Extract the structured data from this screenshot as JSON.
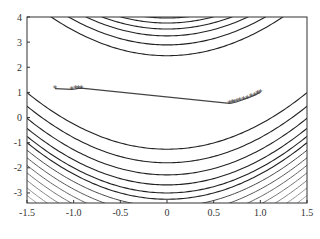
{
  "chart_data": {
    "type": "line",
    "title": "",
    "xlabel": "",
    "ylabel": "",
    "xlim": [
      -1.5,
      1.5
    ],
    "ylim": [
      -3.4,
      4
    ],
    "grid": false,
    "legend": null,
    "x_ticks": [
      -1.5,
      -1.0,
      -0.5,
      0,
      0.5,
      1.0,
      1.5
    ],
    "x_tick_labels": [
      "-1.5",
      "-1.0",
      "-0.5",
      "0",
      "0.5",
      "1.0",
      "1.5"
    ],
    "y_ticks": [
      -3,
      -2,
      -1,
      0,
      1,
      2,
      3,
      4
    ],
    "y_tick_labels": [
      "-3",
      "-2",
      "-1",
      "0",
      "1",
      "2",
      "3",
      "4"
    ],
    "background": {
      "type": "contour",
      "description": "Level curves of a Rosenbrock-like function, parabolic curves y = x^2 + offset",
      "upper_offsets": [
        2.46,
        2.89,
        3.25,
        3.52,
        3.76,
        3.96,
        4.15,
        4.32
      ],
      "lower_offsets": [
        -1.26,
        -1.8,
        -2.28,
        -2.68,
        -3.0,
        -3.25,
        -3.55,
        -3.85,
        -4.15,
        -4.45,
        -4.75,
        -5.05,
        -5.35,
        -5.65,
        -5.95
      ],
      "line_color": "#222222",
      "fade_color": "#bbbbbb"
    },
    "series": [
      {
        "name": "optimization path",
        "marker": "*",
        "color": "#444444",
        "points": [
          [
            -1.2,
            1.15
          ],
          [
            -1.02,
            1.12
          ],
          [
            -0.98,
            1.14
          ],
          [
            -0.95,
            1.16
          ],
          [
            -0.92,
            1.17
          ],
          [
            0.67,
            0.56
          ],
          [
            0.7,
            0.58
          ],
          [
            0.72,
            0.6
          ],
          [
            0.75,
            0.63
          ],
          [
            0.78,
            0.67
          ],
          [
            0.82,
            0.72
          ],
          [
            0.86,
            0.77
          ],
          [
            0.9,
            0.83
          ],
          [
            0.94,
            0.89
          ],
          [
            0.97,
            0.95
          ],
          [
            1.0,
            1.0
          ]
        ]
      }
    ]
  },
  "colors": {
    "axis": "#333333",
    "path": "#444444",
    "background": "#ffffff"
  }
}
